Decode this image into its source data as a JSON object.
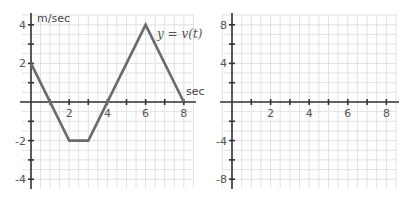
{
  "chart_data": [
    {
      "type": "line",
      "title": "",
      "xlabel": "sec",
      "ylabel": "m/sec",
      "annotation": "y = v(t)",
      "xlim": [
        0,
        8.5
      ],
      "ylim": [
        -4.5,
        4.5
      ],
      "grid": true,
      "x_ticks": [
        1,
        2,
        3,
        4,
        5,
        6,
        7,
        8
      ],
      "x_tick_labels": [
        "2",
        "4",
        "6",
        "8"
      ],
      "x_tick_label_values": [
        2,
        4,
        6,
        8
      ],
      "y_ticks": [
        -4,
        -3,
        -2,
        -1,
        1,
        2,
        3,
        4
      ],
      "y_tick_labels": [
        "4",
        "2",
        "-2",
        "-4"
      ],
      "y_tick_label_values": [
        4,
        2,
        -2,
        -4
      ],
      "series": [
        {
          "name": "v(t)",
          "color": "#6b6b6b",
          "x": [
            0,
            2,
            3,
            6,
            8
          ],
          "y": [
            2,
            -2,
            -2,
            4,
            0
          ]
        }
      ]
    },
    {
      "type": "line",
      "title": "",
      "xlabel": "",
      "ylabel": "",
      "xlim": [
        0,
        8.5
      ],
      "ylim": [
        -9,
        9
      ],
      "grid": true,
      "x_ticks": [
        1,
        2,
        3,
        4,
        5,
        6,
        7,
        8
      ],
      "x_tick_labels": [
        "2",
        "4",
        "6",
        "8"
      ],
      "x_tick_label_values": [
        2,
        4,
        6,
        8
      ],
      "y_ticks": [
        -8,
        -6,
        -4,
        -2,
        2,
        4,
        6,
        8
      ],
      "y_tick_labels": [
        "8",
        "4",
        "-4",
        "-8"
      ],
      "y_tick_label_values": [
        8,
        4,
        -4,
        -8
      ],
      "series": []
    }
  ],
  "colors": {
    "grid": "#e2e2e2",
    "axis": "#333333",
    "curve": "#6b6b6b"
  }
}
